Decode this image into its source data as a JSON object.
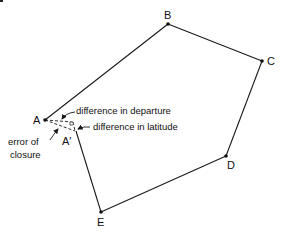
{
  "diagram": {
    "type": "traverse-closure",
    "colors": {
      "line": "#1a1a1a",
      "text": "#111111",
      "background": "#ffffff"
    },
    "vertices": [
      {
        "id": "A",
        "label": "A",
        "x": 45,
        "y": 120
      },
      {
        "id": "B",
        "label": "B",
        "x": 168,
        "y": 24
      },
      {
        "id": "C",
        "label": "C",
        "x": 262,
        "y": 61
      },
      {
        "id": "D",
        "label": "D",
        "x": 226,
        "y": 156
      },
      {
        "id": "E",
        "label": "E",
        "x": 101,
        "y": 212
      },
      {
        "id": "A2",
        "label": "A′",
        "x": 75,
        "y": 131
      }
    ],
    "edges": [
      "A-B",
      "B-C",
      "C-D",
      "D-E",
      "E-A′"
    ],
    "annotations": {
      "departure": "difference in departure",
      "latitude": "difference in latitude",
      "closure_line1": "error of",
      "closure_line2": "closure"
    }
  }
}
